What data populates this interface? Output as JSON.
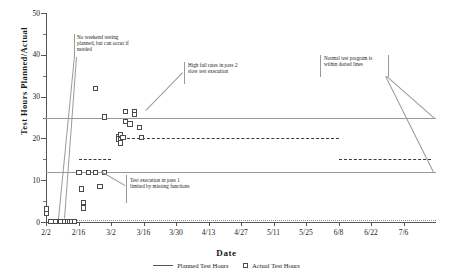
{
  "chart_data": {
    "type": "scatter",
    "title": "",
    "xlabel": "Date",
    "ylabel": "Test Hours Planned/Actual",
    "ylim": [
      0,
      50
    ],
    "ytick_labels": [
      "0",
      "10",
      "20",
      "30",
      "40",
      "50"
    ],
    "ytick_values": [
      0,
      10,
      20,
      30,
      40,
      50
    ],
    "yminor_values": [
      5,
      15,
      25,
      35,
      45
    ],
    "grid": false,
    "xtick_labels": [
      "2/2",
      "2/16",
      "3/2",
      "3/16",
      "3/30",
      "4/13",
      "4/27",
      "5/11",
      "5/25",
      "6/8",
      "6/22",
      "7/6"
    ],
    "xlim_days": [
      0,
      168
    ],
    "xtick_days": [
      0,
      14,
      28,
      42,
      56,
      70,
      84,
      98,
      112,
      126,
      140,
      154
    ],
    "legend_position": "bottom",
    "series": [
      {
        "name": "Planned Test Hours",
        "style": "line",
        "segments": [
          {
            "label": "ramp-dashes-15",
            "y": 15,
            "x_start": 14,
            "x_end": 28,
            "dash": true
          },
          {
            "label": "plateau-20",
            "y": 20,
            "x_start": 35,
            "x_end": 126,
            "dash": true
          },
          {
            "label": "step-down-15",
            "y": 15,
            "x_start": 126,
            "x_end": 166,
            "dash": true
          },
          {
            "label": "baseline-zero",
            "y": 0.4,
            "x_start": 2,
            "x_end": 168,
            "dash": true
          }
        ]
      },
      {
        "name": "Actual Test Hours",
        "style": "marker",
        "points": [
          {
            "x": 0,
            "y": 3.2
          },
          {
            "x": 0,
            "y": 2.1
          },
          {
            "x": 2,
            "y": 0.3
          },
          {
            "x": 4,
            "y": 0.3
          },
          {
            "x": 6,
            "y": 0.3
          },
          {
            "x": 8,
            "y": 0.3
          },
          {
            "x": 9,
            "y": 0.3
          },
          {
            "x": 10,
            "y": 0.3
          },
          {
            "x": 11,
            "y": 0.3
          },
          {
            "x": 12,
            "y": 0.3
          },
          {
            "x": 14,
            "y": 12.0
          },
          {
            "x": 15,
            "y": 8.0
          },
          {
            "x": 16,
            "y": 4.8
          },
          {
            "x": 16,
            "y": 3.5
          },
          {
            "x": 18,
            "y": 12.0
          },
          {
            "x": 21,
            "y": 12.0
          },
          {
            "x": 21,
            "y": 32.0
          },
          {
            "x": 23,
            "y": 8.6
          },
          {
            "x": 25,
            "y": 12.0
          },
          {
            "x": 25,
            "y": 25.2
          },
          {
            "x": 31,
            "y": 20.6
          },
          {
            "x": 31,
            "y": 20.0
          },
          {
            "x": 32,
            "y": 21.0
          },
          {
            "x": 32,
            "y": 19.8
          },
          {
            "x": 32,
            "y": 19.0
          },
          {
            "x": 33,
            "y": 20.4
          },
          {
            "x": 34,
            "y": 26.6
          },
          {
            "x": 34,
            "y": 24.2
          },
          {
            "x": 36,
            "y": 23.6
          },
          {
            "x": 38,
            "y": 26.6
          },
          {
            "x": 38,
            "y": 25.9
          },
          {
            "x": 40,
            "y": 22.8
          },
          {
            "x": 41,
            "y": 20.4
          }
        ]
      }
    ],
    "boundary_lines": [
      {
        "label": "upper-normal-bound",
        "y": 25,
        "x_start": 0,
        "x_end": 168
      },
      {
        "label": "lower-normal-bound",
        "y": 12,
        "x_start": 0,
        "x_end": 168
      }
    ],
    "annotations": [
      {
        "id": "no-weekend-testing",
        "text": "No weekend testing\nplanned, but can occur if\nneeded"
      },
      {
        "id": "high-fail-rates",
        "text": "High fail rates in pass 2\nslow test execution"
      },
      {
        "id": "test-execution-limited",
        "text": "Test execution in pass 1\nlimited by missing functions"
      },
      {
        "id": "normal-test-program",
        "text": "Normal test program is\nwithin dotted lines"
      }
    ]
  },
  "legend": {
    "planned_label": "Planned Test Hours",
    "actual_label": "Actual Test Hours"
  }
}
